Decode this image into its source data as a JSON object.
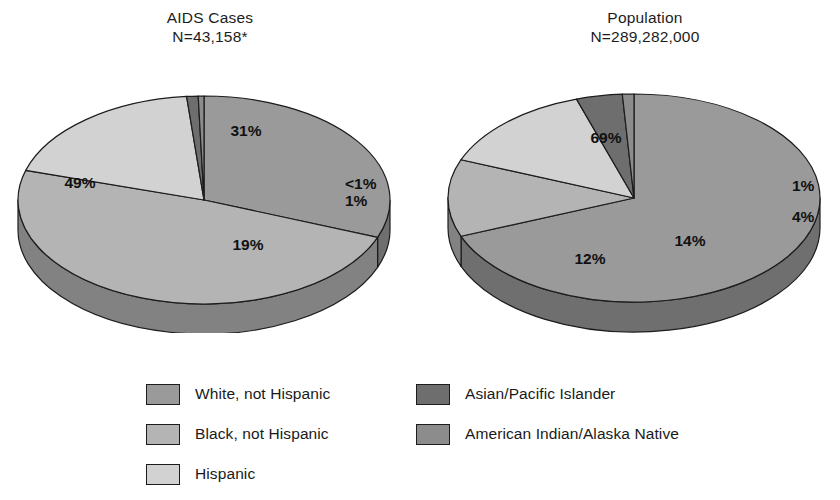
{
  "figure": {
    "background": "#ffffff",
    "text_color": "#1a1a1a"
  },
  "chart_data": {
    "type": "pie",
    "layout": "two 3D pie charts side by side with a shared legend below",
    "legend_position": "bottom",
    "categories": [
      "White, not Hispanic",
      "Black, not Hispanic",
      "Hispanic",
      "Asian/Pacific Islander",
      "American Indian/Alaska Native"
    ],
    "category_colors": [
      "#9a9a9a",
      "#b4b4b4",
      "#d2d2d2",
      "#6e6e6e",
      "#8c8c8c"
    ],
    "charts": [
      {
        "title": "AIDS Cases",
        "subtitle": "N=43,158*",
        "n_label": "N=43,158*",
        "n_value": 43158,
        "footnote_marker": "*",
        "labels": [
          "White, not Hispanic",
          "Black, not Hispanic",
          "Hispanic",
          "Asian/Pacific Islander",
          "American Indian/Alaska Native"
        ],
        "values": [
          31,
          49,
          19,
          1,
          0.5
        ],
        "display_values": [
          "31%",
          "49%",
          "19%",
          "1%",
          "<1%"
        ]
      },
      {
        "title": "Population",
        "subtitle": "N=289,282,000",
        "n_label": "N=289,282,000",
        "n_value": 289282000,
        "labels": [
          "White, not Hispanic",
          "Black, not Hispanic",
          "Hispanic",
          "Asian/Pacific Islander",
          "American Indian/Alaska Native"
        ],
        "values": [
          69,
          12,
          14,
          4,
          1
        ],
        "display_values": [
          "69%",
          "12%",
          "14%",
          "4%",
          "1%"
        ]
      }
    ]
  },
  "charts": {
    "left": {
      "title_line1": "AIDS Cases",
      "title_line2": "N=43,158*",
      "inner_labels": [
        {
          "text": "31%",
          "x": 238,
          "y": 68
        },
        {
          "text": "49%",
          "x": 72,
          "y": 120
        },
        {
          "text": "19%",
          "x": 240,
          "y": 182
        }
      ],
      "edge_labels": [
        {
          "text": "<1%",
          "left": 345,
          "top": 175
        },
        {
          "text": "1%",
          "left": 345,
          "top": 192
        }
      ]
    },
    "right": {
      "title_line1": "Population",
      "title_line2": "N=289,282,000",
      "inner_labels": [
        {
          "text": "69%",
          "x": 168,
          "y": 75
        },
        {
          "text": "12%",
          "x": 152,
          "y": 196
        },
        {
          "text": "14%",
          "x": 252,
          "y": 178
        }
      ],
      "edge_labels": [
        {
          "text": "1%",
          "left": 792,
          "top": 177
        },
        {
          "text": "4%",
          "left": 792,
          "top": 208
        }
      ]
    }
  },
  "legend": {
    "columns": [
      {
        "items": [
          {
            "label": "White, not Hispanic",
            "color": "#9a9a9a"
          },
          {
            "label": "Black, not Hispanic",
            "color": "#b4b4b4"
          },
          {
            "label": "Hispanic",
            "color": "#d2d2d2"
          }
        ]
      },
      {
        "items": [
          {
            "label": "Asian/Pacific Islander",
            "color": "#6e6e6e"
          },
          {
            "label": "American Indian/Alaska Native",
            "color": "#8c8c8c"
          }
        ]
      }
    ]
  }
}
